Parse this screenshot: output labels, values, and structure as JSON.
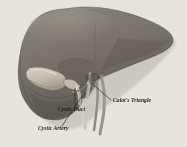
{
  "figure": {
    "background_color": "#eceae4",
    "view": "anterior/inferior surface of liver showing gallbladder, cystic duct, cystic artery and Calot's triangle"
  },
  "colors": {
    "background": "#eceae4",
    "liver_body": "#7b756d",
    "liver_shadow": "#5d5851",
    "liver_highlight": "#938c83",
    "liver_outline": "#4a453f",
    "gallbladder": "#cfc8ba",
    "gallbladder_shade": "#aaa294",
    "duct": "#d9d3c6",
    "artery": "#8f8880",
    "vein": "#9a948c",
    "label_text": "#1c1a18",
    "leader_line": "#2a2724"
  },
  "labels": [
    {
      "id": "calots-triangle",
      "text": "Calot's Triangle",
      "x": 113,
      "y": 102,
      "anchor": "start",
      "leader": {
        "x1": 90,
        "y1": 82,
        "x2": 111,
        "y2": 100
      }
    },
    {
      "id": "cystic-duct",
      "text": "Cystic Duct",
      "x": 58,
      "y": 111,
      "anchor": "start",
      "leader": {
        "x1": 75,
        "y1": 88,
        "x2": 75,
        "y2": 106
      }
    },
    {
      "id": "cystic-artery",
      "text": "Cystic Artery",
      "x": 38,
      "y": 130,
      "anchor": "start",
      "leader": {
        "x1": 82,
        "y1": 96,
        "x2": 62,
        "y2": 126
      }
    }
  ],
  "structures": [
    {
      "id": "right-lobe",
      "name": "Right lobe of liver"
    },
    {
      "id": "left-lobe",
      "name": "Left lobe of liver"
    },
    {
      "id": "gallbladder",
      "name": "Gallbladder"
    },
    {
      "id": "cystic-duct-structure",
      "name": "Cystic duct"
    },
    {
      "id": "common-bile-duct",
      "name": "Common bile duct"
    },
    {
      "id": "cystic-artery-structure",
      "name": "Cystic artery"
    },
    {
      "id": "portal-structures",
      "name": "Portal structures"
    }
  ]
}
